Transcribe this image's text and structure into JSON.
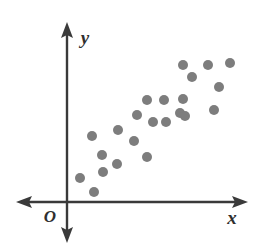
{
  "figure": {
    "width": 261,
    "height": 247,
    "background_color": "#ffffff",
    "axis_color": "#3a3a3a",
    "dot_color": "#7d7d7d",
    "label_color": "#2f2f2f"
  },
  "labels": {
    "x_axis": "x",
    "y_axis": "y",
    "origin": "O"
  },
  "chart_data": {
    "type": "scatter",
    "title": "",
    "subtitle": "",
    "xlabel": "x",
    "ylabel": "y",
    "origin_label": "O",
    "grid": false,
    "legend": false,
    "legend_position": "none",
    "axis_style": "double-headed arrows through origin",
    "x_axis_arrow_both_ends": true,
    "y_axis_arrow_both_ends": true,
    "tick_labels_x": [],
    "tick_labels_y": [],
    "axis_ranges_shown": false,
    "marker": {
      "shape": "circle",
      "radius_px": 5,
      "color": "#7d7d7d",
      "filled": true
    },
    "relationship": "positive linear association",
    "n_points": 23,
    "origin_px": {
      "x": 67,
      "y": 202
    },
    "axis_extent_px": {
      "x_left": 16,
      "x_right": 248,
      "y_top": 22,
      "y_bottom": 243
    },
    "points_px": [
      {
        "x": 80,
        "y": 178
      },
      {
        "x": 94,
        "y": 192
      },
      {
        "x": 103,
        "y": 172
      },
      {
        "x": 102,
        "y": 155
      },
      {
        "x": 117,
        "y": 164
      },
      {
        "x": 92,
        "y": 136
      },
      {
        "x": 118,
        "y": 130
      },
      {
        "x": 134,
        "y": 141
      },
      {
        "x": 147,
        "y": 157
      },
      {
        "x": 137,
        "y": 115
      },
      {
        "x": 153,
        "y": 122
      },
      {
        "x": 147,
        "y": 100
      },
      {
        "x": 164,
        "y": 100
      },
      {
        "x": 183,
        "y": 99
      },
      {
        "x": 180,
        "y": 113
      },
      {
        "x": 185,
        "y": 116
      },
      {
        "x": 183,
        "y": 65
      },
      {
        "x": 192,
        "y": 77
      },
      {
        "x": 208,
        "y": 65
      },
      {
        "x": 219,
        "y": 87
      },
      {
        "x": 214,
        "y": 110
      },
      {
        "x": 230,
        "y": 63
      },
      {
        "x": 166,
        "y": 122
      }
    ],
    "points_data": [
      {
        "x": 1.3,
        "y": 1.2
      },
      {
        "x": 2.7,
        "y": 0.5
      },
      {
        "x": 3.6,
        "y": 1.5
      },
      {
        "x": 3.5,
        "y": 2.4
      },
      {
        "x": 5.0,
        "y": 1.9
      },
      {
        "x": 2.5,
        "y": 3.3
      },
      {
        "x": 5.1,
        "y": 3.6
      },
      {
        "x": 6.7,
        "y": 3.1
      },
      {
        "x": 8.0,
        "y": 2.3
      },
      {
        "x": 7.0,
        "y": 4.4
      },
      {
        "x": 8.6,
        "y": 4.0
      },
      {
        "x": 8.0,
        "y": 5.1
      },
      {
        "x": 9.7,
        "y": 5.1
      },
      {
        "x": 11.6,
        "y": 5.2
      },
      {
        "x": 11.3,
        "y": 4.5
      },
      {
        "x": 11.8,
        "y": 4.3
      },
      {
        "x": 11.6,
        "y": 6.9
      },
      {
        "x": 12.5,
        "y": 6.3
      },
      {
        "x": 14.1,
        "y": 6.9
      },
      {
        "x": 15.2,
        "y": 5.8
      },
      {
        "x": 14.7,
        "y": 4.6
      },
      {
        "x": 16.3,
        "y": 7.0
      },
      {
        "x": 9.9,
        "y": 4.0
      }
    ]
  }
}
